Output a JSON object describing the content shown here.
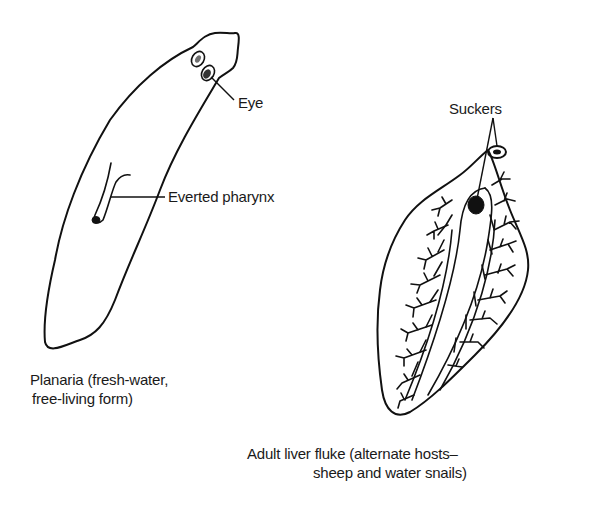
{
  "figure": {
    "organisms": [
      {
        "id": "planaria",
        "caption_lines": [
          "Planaria (fresh-water,",
          "free-living form)"
        ],
        "labels": [
          "Eye",
          "Everted pharynx"
        ]
      },
      {
        "id": "liver-fluke",
        "caption_lines": [
          "Adult liver fluke (alternate hosts–",
          "sheep and water snails)"
        ],
        "labels": [
          "Suckers"
        ]
      }
    ]
  }
}
